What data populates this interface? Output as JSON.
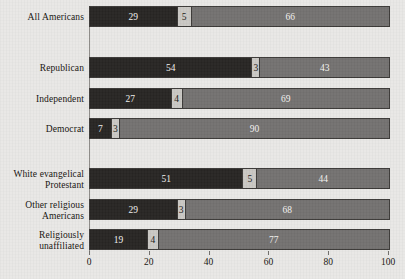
{
  "chart_data": {
    "type": "bar",
    "orientation": "horizontal",
    "stacked": true,
    "title": "",
    "subtitle": "",
    "xlabel": "",
    "ylabel": "",
    "xlim": [
      0,
      100
    ],
    "xticks": [
      0,
      20,
      40,
      60,
      80,
      100
    ],
    "xtick_labels": [
      "0",
      "20",
      "40",
      "60",
      "80",
      "100"
    ],
    "grid": false,
    "legend": "none",
    "series": [
      {
        "name": "segment-1",
        "color": "#272523",
        "values": [
          29,
          54,
          27,
          7,
          51,
          29,
          19
        ]
      },
      {
        "name": "segment-2",
        "color": "#c9c7c3",
        "values": [
          5,
          3,
          4,
          3,
          5,
          3,
          4
        ]
      },
      {
        "name": "segment-3",
        "color": "#737170",
        "values": [
          66,
          43,
          69,
          90,
          44,
          68,
          77
        ]
      }
    ],
    "categories": [
      "All Americans",
      "Republican",
      "Independent",
      "Democrat",
      "White evangelical\nProtestant",
      "Other religious\nAmericans",
      "Religiously\nunaffiliated"
    ],
    "rows": [
      {
        "label": "All Americans",
        "values": [
          29,
          5,
          66
        ],
        "top": 6
      },
      {
        "label": "Republican",
        "values": [
          54,
          3,
          43
        ],
        "top": 57
      },
      {
        "label": "Independent",
        "values": [
          27,
          4,
          69
        ],
        "top": 88
      },
      {
        "label": "Democrat",
        "values": [
          7,
          3,
          90
        ],
        "top": 118
      },
      {
        "label": "White evangelical\nProtestant",
        "values": [
          51,
          5,
          44
        ],
        "top": 168
      },
      {
        "label": "Other religious\nAmericans",
        "values": [
          29,
          3,
          68
        ],
        "top": 199
      },
      {
        "label": "Religiously\nunaffiliated",
        "values": [
          19,
          4,
          77
        ],
        "top": 229
      }
    ]
  },
  "axis": {
    "x_origin_px": 89,
    "x_end_px": 388,
    "baseline_top_px": 6,
    "baseline_bottom_px": 251
  }
}
